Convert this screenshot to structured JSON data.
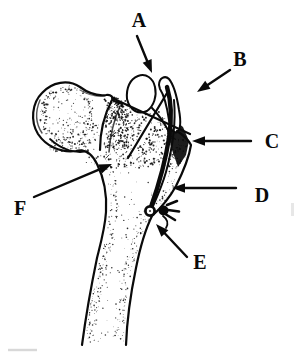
{
  "figure": {
    "description": "Line drawing of a proximal femur showing an osteotomized greater trochanter fragment fixed with a wire loop, lateral wire band and screw button, with structures labeled A through F",
    "ink_color": "#0a0a0a",
    "paper_color": "#ffffff",
    "labels": {
      "a": "A",
      "b": "B",
      "c": "C",
      "d": "D",
      "e": "E",
      "f": "F"
    }
  }
}
